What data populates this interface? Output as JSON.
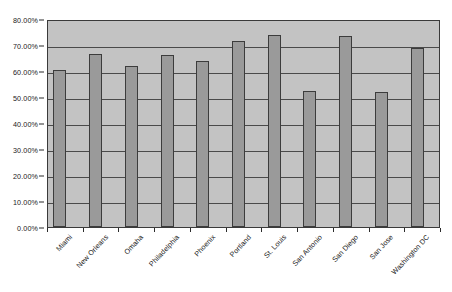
{
  "chart_data": {
    "type": "bar",
    "title": "",
    "xlabel": "",
    "ylabel": "",
    "ylim": [
      0,
      0.8
    ],
    "grid": true,
    "legend": "none",
    "y_tick_labels": [
      "80.00%",
      "70.00%",
      "60.00%",
      "50.00%",
      "40.00%",
      "30.00%",
      "20.00%",
      "10.00%",
      "0.00%"
    ],
    "y_tick_values": [
      0.8,
      0.7,
      0.6,
      0.5,
      0.4,
      0.3,
      0.2,
      0.1,
      0.0
    ],
    "categories": [
      "Miami",
      "New Orleans",
      "Omaha",
      "Philadelphia",
      "Phoenix",
      "Portland",
      "St. Louis",
      "San Antonio",
      "San Diego",
      "San Jose",
      "Washington DC"
    ],
    "values": [
      0.605,
      0.665,
      0.62,
      0.663,
      0.64,
      0.715,
      0.74,
      0.525,
      0.735,
      0.518,
      0.688
    ],
    "value_labels": [
      "60.50%",
      "66.50%",
      "62.00%",
      "66.30%",
      "64.00%",
      "71.50%",
      "74.00%",
      "52.50%",
      "73.50%",
      "51.80%",
      "68.80%"
    ]
  },
  "style": {
    "bar_fill": "#9a9a9a",
    "bar_stroke": "#3c3c3c",
    "plot_background": "#c3c3c3",
    "gridline_color": "#4a4a4a",
    "axis_color": "#2b2b2b",
    "text_color": "#1a1a1a",
    "page_background": "#ffffff"
  }
}
